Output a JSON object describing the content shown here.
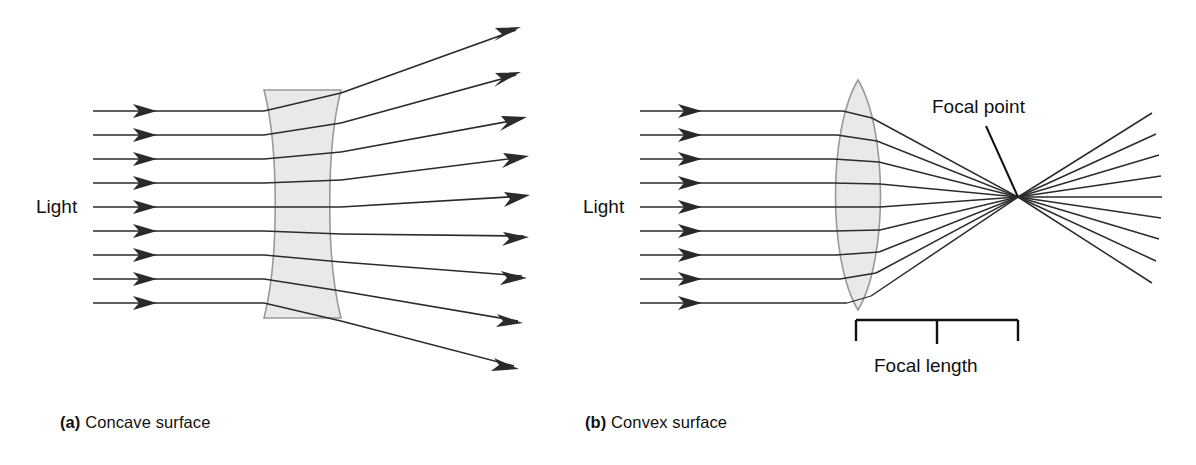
{
  "figure": {
    "background_color": "#ffffff",
    "ray_color": "#2b2b2b",
    "lens_fill_color": "#e9e9e9",
    "lens_edge_color": "#9a9a9a",
    "text_color": "#111111"
  },
  "panels": [
    {
      "id": "a",
      "tag": "(a)",
      "caption_text": "Concave surface",
      "lens_type": "concave",
      "light_label": "Light",
      "incoming_ray_count": 9,
      "outgoing_ray_count": 9,
      "behavior": "diverging"
    },
    {
      "id": "b",
      "tag": "(b)",
      "caption_text": "Convex surface",
      "lens_type": "convex",
      "light_label": "Light",
      "incoming_ray_count": 9,
      "outgoing_ray_count": 9,
      "behavior": "converging",
      "focal_point_label": "Focal point",
      "focal_length_label": "Focal length"
    }
  ],
  "labels": {
    "light_a": "Light",
    "light_b": "Light",
    "focal_point": "Focal point",
    "focal_length": "Focal length",
    "caption_a_tag": "(a)",
    "caption_a_text": "Concave surface",
    "caption_b_tag": "(b)",
    "caption_b_text": "Convex surface"
  },
  "geometry": {
    "concave_lens": {
      "x_left": 264,
      "x_right": 341,
      "y_top": 90,
      "y_bottom": 318
    },
    "convex_lens": {
      "x_left": 833,
      "x_right": 880,
      "y_top": 80,
      "y_bottom": 310
    },
    "focal_point": {
      "x": 1018,
      "y": 197
    },
    "focal_length_bracket": {
      "x_start": 856,
      "x_end": 1018,
      "y": 320
    },
    "ray_start_a": 93,
    "ray_start_b": 640,
    "ray_first_y": 111,
    "ray_spacing": 24
  }
}
